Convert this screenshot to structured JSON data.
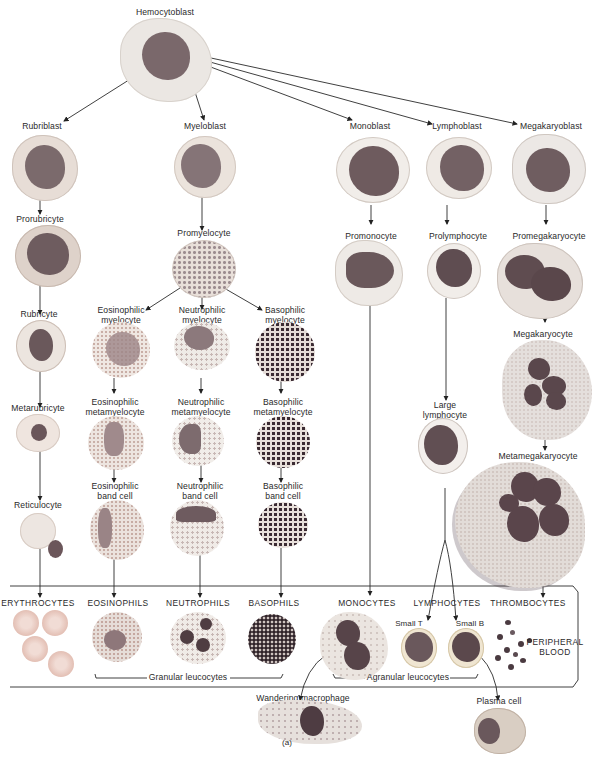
{
  "figure": {
    "title": "Hemocytoblast",
    "panel_label": "(a)",
    "colors": {
      "nucleus": "#6f5a5e",
      "nucleus_dark": "#4a3a40",
      "cytoplasm_light": "#e9e3df",
      "cytoplasm_pink": "#e8c9c1",
      "erythrocyte": "#e6c3b9",
      "granule_dark": "#3b2b33",
      "granule_eosin": "#c99c93",
      "line": "#222222"
    }
  },
  "lineages": [
    {
      "name": "erythroid",
      "stages": [
        "Rubriblast",
        "Prorubricyte",
        "Rubricyte",
        "Metarubricyte",
        "Reticulocyte"
      ],
      "mature": "ERYTHROCYTES"
    },
    {
      "name": "myeloid",
      "stages": [
        "Myeloblast",
        "Promyelocyte"
      ],
      "branches": [
        {
          "stages": [
            "Eosinophilic myelocyte",
            "Eosinophilic metamyelocyte",
            "Eosinophilic band cell"
          ],
          "mature": "EOSINOPHILS"
        },
        {
          "stages": [
            "Neutrophilic myelocyte",
            "Neutrophilic metamyelocyte",
            "Neutrophilic band cell"
          ],
          "mature": "NEUTROPHILS"
        },
        {
          "stages": [
            "Basophilic myelocyte",
            "Basophilic metamyelocyte",
            "Basophilic band cell"
          ],
          "mature": "BASOPHILS"
        }
      ]
    },
    {
      "name": "monocytic",
      "stages": [
        "Monoblast",
        "Promonocyte"
      ],
      "mature": "MONOCYTES",
      "tissue": "Wandering macrophage"
    },
    {
      "name": "lymphoid",
      "stages": [
        "Lymphoblast",
        "Prolymphocyte",
        "Large lymphocyte"
      ],
      "mature": "LYMPHOCYTES",
      "subtypes": [
        "Small T",
        "Small B"
      ],
      "tissue": "Plasma cell"
    },
    {
      "name": "megakaryocytic",
      "stages": [
        "Megakaryoblast",
        "Promegakaryocyte",
        "Megakaryocyte",
        "Metamegakaryocyte"
      ],
      "mature": "THROMBOCYTES"
    }
  ],
  "labels": {
    "hemocytoblast": "Hemocytoblast",
    "rubriblast": "Rubriblast",
    "myeloblast": "Myeloblast",
    "monoblast": "Monoblast",
    "lymphoblast": "Lymphoblast",
    "megakaryoblast": "Megakaryoblast",
    "prorubricyte": "Prorubricyte",
    "promyelocyte": "Promyelocyte",
    "promonocyte": "Promonocyte",
    "prolymphocyte": "Prolymphocyte",
    "promegakaryocyte": "Promegakaryocyte",
    "rubricyte": "Rubricyte",
    "eos_myelocyte_1": "Eosinophilic",
    "eos_myelocyte_2": "myelocyte",
    "neu_myelocyte_1": "Neutrophilic",
    "neu_myelocyte_2": "myelocyte",
    "baso_myelocyte_1": "Basophilic",
    "baso_myelocyte_2": "myelocyte",
    "megakaryocyte": "Megakaryocyte",
    "metarubricyte": "Metarubricyte",
    "eos_meta_1": "Eosinophilic",
    "eos_meta_2": "metamyelocyte",
    "neu_meta_1": "Neutrophilic",
    "neu_meta_2": "metamyelocyte",
    "baso_meta_1": "Basophilic",
    "baso_meta_2": "metamyelocyte",
    "large_lymph_1": "Large",
    "large_lymph_2": "lymphocyte",
    "metamegakaryocyte": "Metamegakaryocyte",
    "reticulocyte": "Reticulocyte",
    "eos_band_1": "Eosinophilic",
    "eos_band_2": "band cell",
    "neu_band_1": "Neutrophilic",
    "neu_band_2": "band cell",
    "baso_band_1": "Basophilic",
    "baso_band_2": "band cell",
    "erythrocytes": "ERYTHROCYTES",
    "eosinophils": "EOSINOPHILS",
    "neutrophils": "NEUTROPHILS",
    "basophils": "BASOPHILS",
    "monocytes": "MONOCYTES",
    "lymphocytes": "LYMPHOCYTES",
    "thrombocytes": "THROMBOCYTES",
    "small_t": "Small T",
    "small_b": "Small B",
    "peripheral_1": "PERIPHERAL",
    "peripheral_2": "BLOOD",
    "granular": "Granular leucocytes",
    "agranular": "Agranular leucocytes",
    "wandering": "Wandering macrophage",
    "plasma": "Plasma cell",
    "panel": "(a)"
  }
}
